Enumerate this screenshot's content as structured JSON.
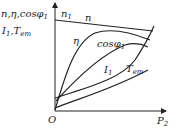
{
  "diagram": {
    "y_axis_label_line1": "n,η,cosφ",
    "y_axis_label_line1_sub": "1",
    "y_axis_label_line2_a": "I",
    "y_axis_label_line2_a_sub": "1",
    "y_axis_label_line2_b": ",T",
    "y_axis_label_line2_b_sub": "em",
    "x_axis_label": "P",
    "x_axis_label_sub": "2",
    "origin_label": "O",
    "curves": [
      {
        "id": "n",
        "label": "n",
        "shape": "slightly decreasing line"
      },
      {
        "id": "n1",
        "label": "n",
        "label_sub": "1",
        "shape": "synchronous speed marker"
      },
      {
        "id": "eta",
        "label": "η",
        "shape": "rises steeply from 0, peaks, slightly decreases"
      },
      {
        "id": "cosphi",
        "label": "cosφ",
        "label_sub": "1",
        "shape": "rises from no-load value, peaks near rated"
      },
      {
        "id": "I1",
        "label": "I",
        "label_sub": "1",
        "shape": "rises from no-load current, concave up"
      },
      {
        "id": "Tem",
        "label": "T",
        "label_sub": "em",
        "shape": "rises nearly linearly"
      }
    ]
  }
}
